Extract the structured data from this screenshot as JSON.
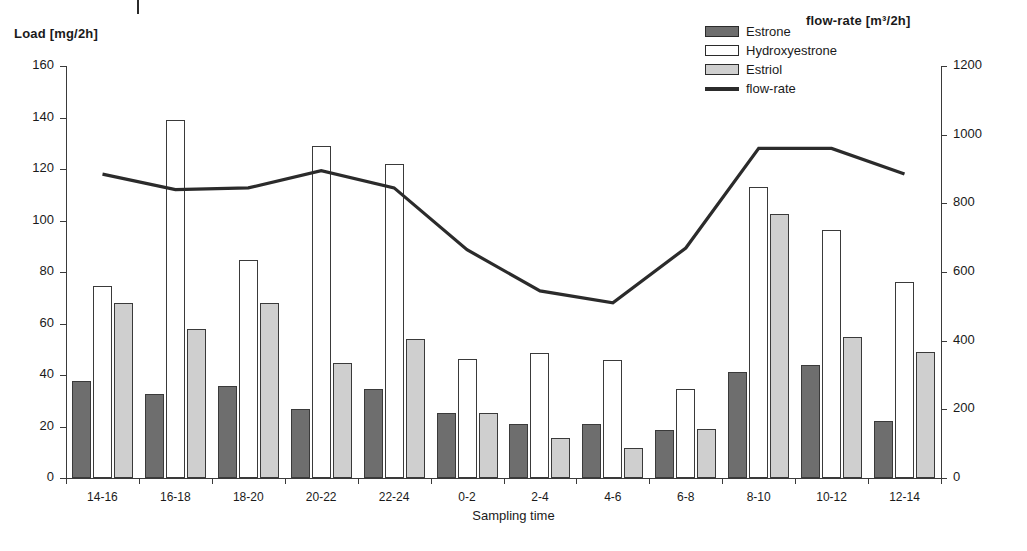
{
  "axes": {
    "left_title": "Load [mg/2h]",
    "right_title": "flow-rate [m³/2h]",
    "x_title": "Sampling time"
  },
  "legend": {
    "items": [
      {
        "label": "Estrone",
        "swatch": "estrone-swatch",
        "color": "#6e6e6e"
      },
      {
        "label": "Hydroxyestrone",
        "swatch": "hydroxyestrone-swatch",
        "color": "#ffffff"
      },
      {
        "label": "Estriol",
        "swatch": "estriol-swatch",
        "color": "#cfcfcf"
      },
      {
        "label": "flow-rate",
        "swatch": "flowrate-line-swatch",
        "color": "#2b2b2b"
      }
    ]
  },
  "chart_data": {
    "type": "bar",
    "title": "",
    "xlabel": "Sampling time",
    "ylabel": "Load [mg/2h]",
    "y2label": "flow-rate [m³/2h]",
    "ylim": [
      0,
      160
    ],
    "y2lim": [
      0,
      1200
    ],
    "yticks": [
      0,
      20,
      40,
      60,
      80,
      100,
      120,
      140,
      160
    ],
    "y2ticks": [
      0,
      200,
      400,
      600,
      800,
      1000,
      1200
    ],
    "grid": false,
    "legend_position": "top-right",
    "categories": [
      "14-16",
      "16-18",
      "18-20",
      "20-22",
      "22-24",
      "0-2",
      "2-4",
      "4-6",
      "6-8",
      "8-10",
      "10-12",
      "12-14"
    ],
    "series": [
      {
        "name": "Estrone",
        "axis": "left",
        "color": "#6e6e6e",
        "values": [
          37.8,
          32.8,
          35.8,
          26.8,
          34.6,
          25.2,
          20.8,
          20.8,
          18.8,
          41.3,
          43.8,
          22.0
        ]
      },
      {
        "name": "Hydroxyestrone",
        "axis": "left",
        "color": "#ffffff",
        "values": [
          74.6,
          139.0,
          84.6,
          128.8,
          122.0,
          46.2,
          48.6,
          46.0,
          34.4,
          113.0,
          96.5,
          76.0
        ]
      },
      {
        "name": "Estriol",
        "axis": "left",
        "color": "#cfcfcf",
        "values": [
          68.0,
          57.8,
          68.0,
          44.6,
          54.0,
          25.4,
          15.6,
          11.8,
          19.2,
          102.4,
          54.8,
          49.0
        ]
      },
      {
        "name": "flow-rate",
        "axis": "right",
        "type": "line",
        "color": "#2b2b2b",
        "values": [
          885,
          840,
          845,
          895,
          845,
          665,
          545,
          510,
          670,
          960,
          960,
          885
        ]
      }
    ]
  }
}
